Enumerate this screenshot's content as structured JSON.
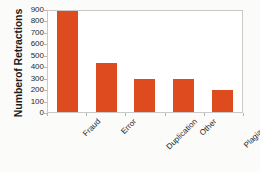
{
  "chart_data": {
    "type": "bar",
    "title": "",
    "xlabel": "",
    "ylabel": "Numberof Retractions",
    "categories": [
      "Fraud",
      "Error",
      "Duplication",
      "Other",
      "Plagiarism"
    ],
    "values": [
      880,
      430,
      290,
      285,
      195
    ],
    "ylim": [
      0,
      900
    ],
    "ytick_labels": [
      "0",
      "100",
      "200",
      "300",
      "400",
      "500",
      "600",
      "700",
      "800",
      "900"
    ],
    "ytick_values": [
      0,
      100,
      200,
      300,
      400,
      500,
      600,
      700,
      800,
      900
    ],
    "grid": false,
    "legend": false,
    "legend_position": "none",
    "bar_color": "#de4b1e",
    "plot_border_color": "#c9c9c9",
    "axis_text_color": "#1f1f1f",
    "background_color": "#ffffff",
    "xtick_label_rotation": -45
  }
}
